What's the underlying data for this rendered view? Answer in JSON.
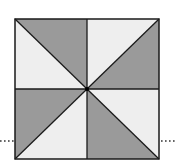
{
  "diagram": {
    "square": {
      "x0": 15,
      "y0": 19,
      "x1": 159,
      "y1": 159,
      "cx": 87,
      "cy": 89
    },
    "colors": {
      "dark": "#9a9a9a",
      "light": "#eeeeee",
      "stroke": "#1a1a1a",
      "dots": "#333333"
    },
    "regions": [
      {
        "name": "top-left-upper",
        "shade": "dark"
      },
      {
        "name": "top-left-lower",
        "shade": "light"
      },
      {
        "name": "top-right-upper",
        "shade": "light"
      },
      {
        "name": "top-right-lower",
        "shade": "dark"
      },
      {
        "name": "bottom-left-upper",
        "shade": "dark"
      },
      {
        "name": "bottom-left-lower",
        "shade": "light"
      },
      {
        "name": "bottom-right-upper",
        "shade": "light"
      },
      {
        "name": "bottom-right-lower",
        "shade": "dark"
      }
    ],
    "dotted_line": {
      "y": 141,
      "left": [
        0,
        15
      ],
      "right": [
        159,
        177
      ]
    }
  }
}
